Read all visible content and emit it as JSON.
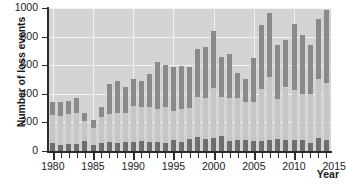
{
  "chart_data": {
    "type": "bar",
    "subtype": "stacked-bar",
    "title": "",
    "xlabel": "Year",
    "ylabel": "Number of loss events",
    "xlim": [
      1979.4,
      2014.6
    ],
    "ylim": [
      0,
      1000
    ],
    "ytick_labels": [
      "0",
      "200",
      "400",
      "600",
      "800",
      "1000"
    ],
    "ytick_values": [
      0,
      200,
      400,
      600,
      800,
      1000
    ],
    "xtick_labels": [
      "1980",
      "1985",
      "1990",
      "1995",
      "2000",
      "2005",
      "2010",
      "2015"
    ],
    "xtick_values": [
      1980,
      1985,
      1990,
      1995,
      2000,
      2005,
      2010,
      2015
    ],
    "grid": "horizontal-and-vertical-white-on-gray",
    "legend": "none",
    "categories": [
      1980,
      1981,
      1982,
      1983,
      1984,
      1985,
      1986,
      1987,
      1988,
      1989,
      1990,
      1991,
      1992,
      1993,
      1994,
      1995,
      1996,
      1997,
      1998,
      1999,
      2000,
      2001,
      2002,
      2003,
      2004,
      2005,
      2006,
      2007,
      2008,
      2009,
      2010,
      2011,
      2012,
      2013,
      2014
    ],
    "series": [
      {
        "name": "Geophysical events",
        "color": "#6e6e6e",
        "values": [
          58,
          45,
          51,
          52,
          70,
          42,
          55,
          60,
          54,
          62,
          66,
          70,
          62,
          66,
          58,
          78,
          60,
          84,
          100,
          82,
          92,
          106,
          68,
          74,
          74,
          72,
          72,
          78,
          82,
          76,
          80,
          78,
          58,
          88,
          78
        ]
      },
      {
        "name": "Meteorological and hydrological events",
        "color": "#c6c6c6",
        "values": [
          192,
          198,
          210,
          212,
          140,
          118,
          180,
          198,
          210,
          206,
          250,
          238,
          246,
          230,
          252,
          200,
          232,
          220,
          280,
          290,
          350,
          270,
          300,
          300,
          270,
          270,
          360,
          440,
          280,
          368,
          350,
          324,
          338,
          414,
          400
        ]
      },
      {
        "name": "Climatological events",
        "color": "#8a8a8a",
        "values": [
          95,
          101,
          88,
          110,
          53,
          58,
          75,
          210,
          225,
          180,
          185,
          185,
          230,
          324,
          288,
          310,
          300,
          280,
          336,
          356,
          396,
          280,
          310,
          174,
          158,
          306,
          452,
          446,
          382,
          334,
          458,
          408,
          348,
          420,
          508
        ]
      }
    ],
    "totals": [
      345,
      344,
      349,
      374,
      263,
      218,
      310,
      468,
      489,
      448,
      501,
      493,
      538,
      620,
      598,
      588,
      592,
      584,
      716,
      728,
      838,
      656,
      678,
      548,
      502,
      648,
      884,
      964,
      744,
      778,
      888,
      810,
      744,
      922,
      986
    ]
  }
}
